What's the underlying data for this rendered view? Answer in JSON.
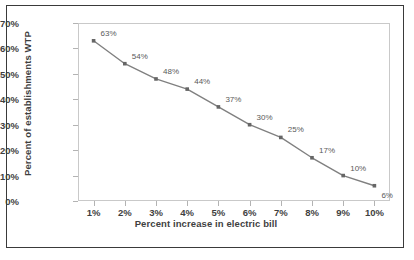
{
  "chart_data": {
    "type": "line",
    "title": "",
    "xlabel": "Percent increase in electric bill",
    "ylabel": "Percent of establishments WTP",
    "categories": [
      "1%",
      "2%",
      "3%",
      "4%",
      "5%",
      "6%",
      "7%",
      "8%",
      "9%",
      "10%"
    ],
    "x": [
      1,
      2,
      3,
      4,
      5,
      6,
      7,
      8,
      9,
      10
    ],
    "values": [
      63,
      54,
      48,
      44,
      37,
      30,
      25,
      17,
      10,
      6
    ],
    "point_labels": [
      "63%",
      "54%",
      "48%",
      "44%",
      "37%",
      "30%",
      "25%",
      "17%",
      "10%",
      "6%"
    ],
    "ylim": [
      0,
      70
    ],
    "ytick_labels": [
      "0%",
      "10%",
      "20%",
      "30%",
      "40%",
      "50%",
      "60%",
      "70%"
    ],
    "ytick_values": [
      0,
      10,
      20,
      30,
      40,
      50,
      60,
      70
    ],
    "grid": false,
    "legend": "none",
    "series_color": "#808080",
    "marker_color": "#666666",
    "axis_color": "#c9c9c9",
    "text_color": "#3f3f3f",
    "frame_color": "#3a3a3a",
    "background": "#ffffff"
  }
}
